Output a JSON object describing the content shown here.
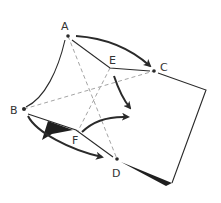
{
  "diagram": {
    "type": "folded-sheet-geometry",
    "colors": {
      "ink": "#2a2a2a",
      "dashed": "#9a9a9a",
      "background": "#ffffff"
    },
    "points": [
      {
        "id": "A",
        "label": "A",
        "x": 68,
        "y": 36,
        "lx": 61,
        "ly": 30
      },
      {
        "id": "B",
        "label": "B",
        "x": 24,
        "y": 109,
        "lx": 10,
        "ly": 114
      },
      {
        "id": "C",
        "label": "C",
        "x": 154,
        "y": 71,
        "lx": 160,
        "ly": 71
      },
      {
        "id": "D",
        "label": "D",
        "x": 117,
        "y": 159,
        "lx": 112,
        "ly": 177
      },
      {
        "id": "E",
        "label": "E",
        "x": 110,
        "y": 68,
        "lx": 109,
        "ly": 64
      },
      {
        "id": "F",
        "label": "F",
        "x": 78,
        "y": 131,
        "lx": 72,
        "ly": 144
      }
    ],
    "arrows": [
      {
        "name": "arrow-A-to-C",
        "description": "curved arrow from A toward C"
      },
      {
        "name": "arrow-E-down",
        "description": "curved arrow from E downward toward center"
      },
      {
        "name": "arrow-F-right",
        "description": "curved arrow from F toward right"
      },
      {
        "name": "arrow-B-to-D",
        "description": "curved arrow from B toward D"
      }
    ]
  }
}
